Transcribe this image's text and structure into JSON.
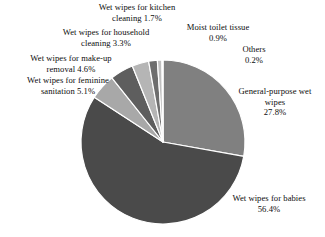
{
  "chart_data": {
    "type": "pie",
    "title": "",
    "subtitle": "",
    "unit": "%",
    "legend_position": "callout-labels",
    "grid": false,
    "start_angle_deg": 0,
    "direction": "clockwise",
    "categories": [
      "General-purpose wet wipes",
      "Wet wipes for babies",
      "Wet wipes for feminine sanitation",
      "Wet wipes for make-up removal",
      "Wet wipes for household cleaning",
      "Wet wipes for kitchen cleaning",
      "Moist toilet tissue",
      "Others"
    ],
    "values": [
      27.8,
      56.4,
      5.1,
      4.6,
      3.3,
      1.7,
      0.9,
      0.2
    ],
    "value_labels": [
      "27.8%",
      "56.4%",
      "5.1%",
      "4.6%",
      "3.3%",
      "1.7%",
      "0.9%",
      "0.2%"
    ],
    "colors": [
      "#808080",
      "#4a4a4a",
      "#a8a8a8",
      "#5e5e5e",
      "#b5b5b5",
      "#6e6e6e",
      "#c0c0c0",
      "#8c8c8c"
    ],
    "slice_edge_color": "#ffffff",
    "total": 100.0
  },
  "labels": {
    "kitchen": {
      "name": "Wet wipes for kitchen\ncleaning",
      "value": "1.7%",
      "text": "Wet wipes for kitchen\ncleaning  1.7%"
    },
    "household": {
      "name": "Wet wipes for household\ncleaning",
      "value": "3.3%",
      "text": "Wet wipes for household\ncleaning  3.3%"
    },
    "makeup": {
      "name": "Wet wipes for make-up\nremoval",
      "value": "4.6%",
      "text": "Wet wipes for make-up\nremoval  4.6%"
    },
    "feminine": {
      "name": "Wet wipes for feminine\nsanitation",
      "value": "5.1%",
      "text": "Wet wipes for feminine\nsanitation  5.1%"
    },
    "moist": {
      "name": "Moist toilet tissue",
      "value": "0.9%",
      "text": "Moist toilet tissue\n0.9%"
    },
    "others": {
      "name": "Others",
      "value": "0.2%",
      "text": "Others\n0.2%"
    },
    "general": {
      "name": "General-purpose wet\nwipes",
      "value": "27.8%",
      "text": "General-purpose wet\nwipes\n27.8%"
    },
    "babies": {
      "name": "Wet wipes for babies",
      "value": "56.4%",
      "text": "Wet wipes for babies\n56.4%"
    }
  },
  "figure": {
    "background": "#ffffff",
    "center_x": 163,
    "center_y": 142,
    "radius": 82
  }
}
